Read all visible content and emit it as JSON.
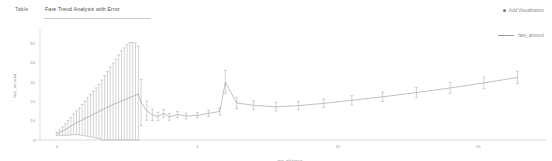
{
  "tabs": [
    {
      "id": "table",
      "label": "Table",
      "active": false
    },
    {
      "id": "fare-trend",
      "label": "Fare Trend Analysis with Error",
      "active": true
    }
  ],
  "actions": {
    "add_visualization_label": "Add Visualization",
    "add_visualization_icon": "plus-dot-icon"
  },
  "legend": {
    "position": "top-right",
    "entries": [
      {
        "label": "fare_amount",
        "color": "#9a9a9a",
        "marker": "line"
      }
    ]
  },
  "colors": {
    "line": "#8e8e8e",
    "error_bar": "#9c9c9c",
    "axis": "#c2c2c2",
    "tick_text": "#9b9b9b",
    "tab_active_underline": "#c9c9c9",
    "background": "#ffffff"
  },
  "chart_data": {
    "type": "line",
    "title": "Fare Trend Analysis with Error",
    "xlabel": "trip_distance",
    "ylabel": "fare_amount",
    "xlim": [
      -0.6,
      17.2
    ],
    "ylim": [
      0,
      56
    ],
    "xticks": [
      0,
      5,
      10,
      15
    ],
    "yticks": [
      0,
      10,
      20,
      30,
      40,
      50
    ],
    "grid": false,
    "legend_position": "top-right",
    "error_bars": true,
    "series": [
      {
        "name": "fare_amount",
        "x": [
          0.0,
          0.1,
          0.2,
          0.3,
          0.4,
          0.5,
          0.6,
          0.7,
          0.8,
          0.9,
          1.0,
          1.1,
          1.2,
          1.3,
          1.4,
          1.5,
          1.6,
          1.7,
          1.8,
          1.9,
          2.0,
          2.1,
          2.2,
          2.3,
          2.4,
          2.5,
          2.6,
          2.7,
          2.8,
          2.9,
          3.0,
          3.2,
          3.4,
          3.6,
          3.8,
          4.0,
          4.3,
          4.6,
          5.0,
          5.4,
          5.8,
          6.0,
          6.4,
          7.0,
          7.8,
          8.6,
          9.5,
          10.5,
          11.6,
          12.8,
          14.0,
          15.2,
          16.4
        ],
        "y": [
          3.2,
          3.8,
          4.6,
          5.4,
          6.3,
          7.2,
          8.1,
          9.0,
          9.6,
          10.4,
          11.2,
          11.9,
          12.6,
          13.4,
          14.0,
          14.8,
          15.6,
          16.3,
          17.0,
          17.8,
          18.4,
          19.0,
          19.6,
          20.2,
          20.8,
          21.4,
          22.0,
          22.6,
          23.2,
          23.8,
          19.5,
          15.2,
          13.0,
          12.2,
          13.8,
          12.0,
          13.2,
          12.4,
          12.8,
          13.8,
          14.8,
          30.0,
          19.2,
          18.0,
          17.2,
          17.8,
          19.0,
          20.6,
          22.4,
          24.6,
          27.0,
          29.6,
          32.4
        ],
        "yerr": [
          1.0,
          1.4,
          2.2,
          3.0,
          3.8,
          4.6,
          5.4,
          6.2,
          7.0,
          8.0,
          9.0,
          10.0,
          11.0,
          12.0,
          13.0,
          14.0,
          15.5,
          17.0,
          18.5,
          20.0,
          21.5,
          23.0,
          24.5,
          26.0,
          27.0,
          28.0,
          28.5,
          28.0,
          27.0,
          25.0,
          12.0,
          5.0,
          3.0,
          2.2,
          2.0,
          1.8,
          1.6,
          1.5,
          1.5,
          1.6,
          1.8,
          6.0,
          3.0,
          2.4,
          2.2,
          2.2,
          2.2,
          2.4,
          2.4,
          2.6,
          2.8,
          3.0,
          3.2
        ]
      }
    ]
  }
}
